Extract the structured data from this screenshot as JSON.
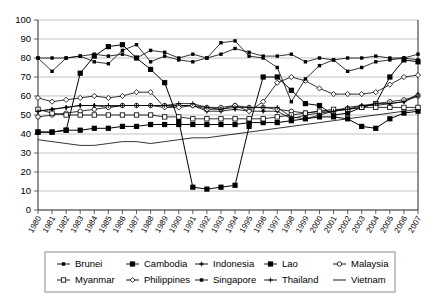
{
  "chart_data": {
    "type": "line",
    "title": "",
    "xlabel": "",
    "ylabel": "",
    "ylim": [
      0,
      100
    ],
    "ytick_step": 10,
    "grid": true,
    "legend_position": "bottom",
    "x": [
      1980,
      1981,
      1982,
      1983,
      1984,
      1985,
      1986,
      1987,
      1988,
      1989,
      1990,
      1991,
      1992,
      1993,
      1994,
      1995,
      1996,
      1997,
      1998,
      1999,
      2000,
      2001,
      2002,
      2003,
      2004,
      2005,
      2006,
      2007
    ],
    "yticks": [
      0,
      10,
      20,
      30,
      40,
      50,
      60,
      70,
      80,
      90,
      100
    ],
    "series": [
      {
        "name": "Brunei",
        "marker": "small-filled-square",
        "values": [
          80,
          80,
          80,
          81,
          82,
          81,
          82,
          80,
          84,
          83,
          80,
          82,
          80,
          82,
          85,
          83,
          81,
          81,
          82,
          78,
          80,
          79,
          80,
          80,
          81,
          80,
          80,
          82
        ]
      },
      {
        "name": "Cambodia",
        "marker": "filled-square",
        "values": [
          41,
          41,
          42,
          72,
          81,
          86,
          87,
          80,
          74,
          67,
          47,
          12,
          11,
          12,
          13,
          44,
          70,
          70,
          63,
          56,
          55,
          50,
          51,
          54,
          56,
          70,
          79,
          78
        ]
      },
      {
        "name": "Indonesia",
        "marker": "small-plus-filled",
        "values": [
          52,
          53,
          54,
          55,
          55,
          54,
          55,
          55,
          55,
          54,
          55,
          55,
          52,
          52,
          53,
          52,
          52,
          52,
          48,
          50,
          51,
          52,
          54,
          55,
          55,
          56,
          57,
          61
        ]
      },
      {
        "name": "Lao",
        "marker": "filled-square",
        "values": [
          41,
          41,
          42,
          42,
          43,
          43,
          44,
          44,
          45,
          45,
          45,
          45,
          45,
          45,
          45,
          46,
          46,
          46,
          47,
          48,
          49,
          49,
          48,
          44,
          43,
          48,
          51,
          52
        ]
      },
      {
        "name": "Malaysia",
        "marker": "open-circle",
        "values": [
          49,
          50,
          51,
          52,
          53,
          54,
          55,
          55,
          55,
          55,
          55,
          55,
          54,
          54,
          55,
          54,
          54,
          53,
          52,
          51,
          52,
          52,
          53,
          54,
          56,
          57,
          58,
          60
        ]
      },
      {
        "name": "Myanmar",
        "marker": "open-square",
        "values": [
          53,
          51,
          50,
          50,
          50,
          50,
          50,
          50,
          50,
          49,
          49,
          48,
          48,
          48,
          48,
          48,
          48,
          49,
          50,
          51,
          52,
          53,
          53,
          54,
          54,
          54,
          54,
          54
        ]
      },
      {
        "name": "Philippines",
        "marker": "open-diamond",
        "values": [
          59,
          57,
          58,
          59,
          60,
          59,
          60,
          62,
          62,
          54,
          54,
          55,
          53,
          53,
          55,
          52,
          57,
          67,
          70,
          68,
          64,
          61,
          61,
          61,
          62,
          66,
          70,
          71
        ]
      },
      {
        "name": "Singapore",
        "marker": "small-filled-square",
        "values": [
          80,
          73,
          80,
          81,
          78,
          77,
          84,
          87,
          78,
          81,
          79,
          78,
          80,
          88,
          89,
          81,
          80,
          75,
          57,
          69,
          76,
          79,
          73,
          75,
          78,
          79,
          80,
          79
        ]
      },
      {
        "name": "Thailand",
        "marker": "small-plus",
        "values": [
          52,
          53,
          54,
          55,
          55,
          55,
          55,
          55,
          55,
          55,
          56,
          56,
          54,
          53,
          54,
          54,
          54,
          54,
          49,
          48,
          50,
          52,
          53,
          55,
          56,
          56,
          57,
          60
        ]
      },
      {
        "name": "Vietnam",
        "marker": "none",
        "values": [
          37,
          36,
          35,
          34,
          34,
          35,
          36,
          36,
          35,
          36,
          37,
          38,
          38,
          39,
          40,
          41,
          42,
          43,
          44,
          45,
          46,
          47,
          48,
          49,
          50,
          51,
          52,
          53
        ]
      }
    ]
  },
  "legend": {
    "row1": [
      "Brunei",
      "Cambodia",
      "Indonesia",
      "Lao",
      "Malaysia"
    ],
    "row2": [
      "Myanmar",
      "Philippines",
      "Singapore",
      "Thailand",
      "Vietnam"
    ]
  },
  "colors": {
    "ink": "#000000",
    "grid": "#9a9a9a",
    "axis": "#3a3a3a",
    "legend_border": "#8a8a8a",
    "background": "#ffffff"
  }
}
